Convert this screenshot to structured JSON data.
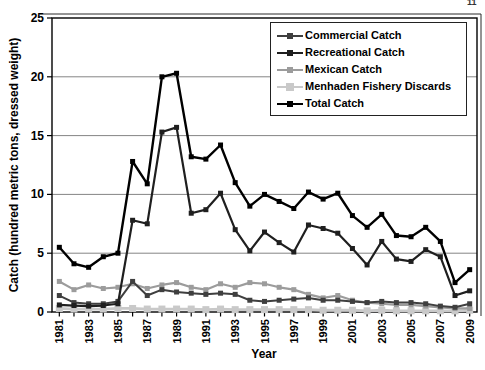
{
  "artifacts": {
    "corner_text": "11"
  },
  "chart_data": {
    "type": "line",
    "title": "",
    "xlabel": "Year",
    "ylabel": "Catch (hundred metric tons, dressed weight)",
    "ylim": [
      0,
      25
    ],
    "yticks": [
      0,
      5,
      10,
      15,
      20,
      25
    ],
    "grid": "horizontal gridlines at 5, 10, 15, 20",
    "legend_position": "boxed, top-right inside plot",
    "x": [
      1981,
      1982,
      1983,
      1984,
      1985,
      1986,
      1987,
      1988,
      1989,
      1990,
      1991,
      1992,
      1993,
      1994,
      1995,
      1996,
      1997,
      1998,
      1999,
      2000,
      2001,
      2002,
      2003,
      2004,
      2005,
      2006,
      2007,
      2008,
      2009
    ],
    "xtick_labels": [
      "1981",
      "1983",
      "1985",
      "1987",
      "1989",
      "1991",
      "1993",
      "1995",
      "1997",
      "1999",
      "2001",
      "2003",
      "2005",
      "2007",
      "2009"
    ],
    "series": [
      {
        "name": "Commercial Catch",
        "color": "#3f3f3f",
        "values": [
          1.4,
          0.8,
          0.7,
          0.7,
          0.9,
          2.6,
          1.4,
          1.9,
          1.7,
          1.6,
          1.5,
          1.6,
          1.5,
          1.0,
          0.9,
          1.0,
          1.1,
          1.2,
          1.0,
          1.0,
          0.9,
          0.8,
          0.9,
          0.8,
          0.8,
          0.7,
          0.5,
          0.4,
          0.7
        ]
      },
      {
        "name": "Recreational Catch",
        "color": "#1f1f1f",
        "values": [
          0.6,
          0.55,
          0.5,
          0.55,
          0.7,
          7.8,
          7.5,
          15.3,
          15.7,
          8.4,
          8.7,
          10.1,
          7.0,
          5.2,
          6.8,
          5.9,
          5.1,
          7.4,
          7.1,
          6.7,
          5.4,
          4.0,
          6.0,
          4.5,
          4.3,
          5.3,
          4.7,
          1.4,
          1.8
        ]
      },
      {
        "name": "Mexican Catch",
        "color": "#9c9c9c",
        "values": [
          2.6,
          1.9,
          2.3,
          2.0,
          2.1,
          2.4,
          2.0,
          2.3,
          2.5,
          2.1,
          1.9,
          2.4,
          2.1,
          2.5,
          2.4,
          2.1,
          1.9,
          1.5,
          1.2,
          1.4,
          1.0,
          0.8,
          0.7,
          0.6,
          0.6,
          0.5,
          0.4,
          0.3,
          0.3
        ]
      },
      {
        "name": "Menhaden Fishery Discards",
        "color": "#c9c9c9",
        "values": [
          0.3,
          0.25,
          0.25,
          0.25,
          0.3,
          0.3,
          0.25,
          0.25,
          0.25,
          0.25,
          0.2,
          0.25,
          0.2,
          0.2,
          0.2,
          0.2,
          0.2,
          0.2,
          0.15,
          0.15,
          0.15,
          0.1,
          0.15,
          0.1,
          0.1,
          0.1,
          0.1,
          0.1,
          0.15
        ]
      },
      {
        "name": "Total Catch",
        "color": "#000000",
        "values": [
          5.5,
          4.1,
          3.8,
          4.7,
          5.0,
          12.8,
          10.9,
          20.0,
          20.3,
          13.2,
          13.0,
          14.2,
          11.0,
          9.0,
          10.0,
          9.4,
          8.8,
          10.2,
          9.6,
          10.1,
          8.2,
          7.2,
          8.3,
          6.5,
          6.4,
          7.2,
          6.0,
          2.5,
          3.6
        ]
      }
    ]
  }
}
